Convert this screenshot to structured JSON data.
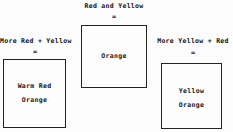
{
  "diagram": {
    "equals_sign": "=",
    "groups": [
      {
        "id": "center",
        "label": "Red and Yellow",
        "operator": "=",
        "box_lines": [
          "Orange"
        ]
      },
      {
        "id": "left",
        "label": "More Red + Yellow",
        "operator": "=",
        "box_lines": [
          "Warm Red",
          "Orange"
        ]
      },
      {
        "id": "right",
        "label": "More Yellow + Red",
        "operator": "=",
        "box_lines": [
          "Yellow",
          "Orange"
        ]
      }
    ]
  },
  "colors": {
    "background": "#fcfcfc",
    "text": "#141414",
    "box_border": "#232323",
    "box_fill": "#fdfdfd"
  }
}
